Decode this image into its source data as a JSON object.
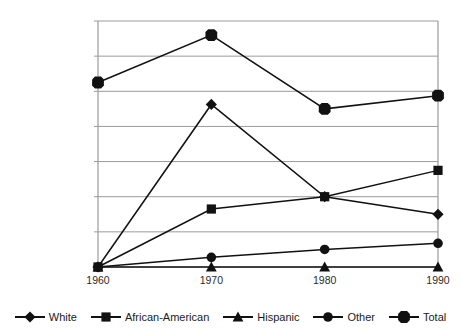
{
  "chart_data": {
    "type": "line",
    "title": "",
    "xlabel": "",
    "ylabel": "",
    "x": [
      1960,
      1970,
      1980,
      1990
    ],
    "categories": [
      "1960",
      "1970",
      "1980",
      "1990"
    ],
    "ylim": [
      0,
      140000
    ],
    "ytick_step": 20000,
    "ytick_labels": [
      "140,000.00",
      "120,000.00",
      "100,000.00",
      "80,000.00",
      "60,000.00",
      "40,000.00",
      "20,000.00",
      "0.00"
    ],
    "ytick_values": [
      140000,
      120000,
      100000,
      80000,
      60000,
      40000,
      20000,
      0
    ],
    "xtick_labels": [
      "1960",
      "1970",
      "1980",
      "1990"
    ],
    "grid": true,
    "grid_axis": "y",
    "legend_position": "bottom",
    "line_color": "#111111",
    "grid_color": "#9a9a9a",
    "series": [
      {
        "name": "White",
        "marker": "diamond",
        "values": [
          0,
          92500,
          40000,
          30000
        ]
      },
      {
        "name": "African-American",
        "marker": "square",
        "values": [
          0,
          33000,
          40000,
          55000
        ]
      },
      {
        "name": "Hispanic",
        "marker": "triangle",
        "values": [
          0,
          0,
          0,
          0
        ]
      },
      {
        "name": "Other",
        "marker": "circle",
        "values": [
          0,
          5500,
          10000,
          13500
        ]
      },
      {
        "name": "Total",
        "marker": "octagon",
        "values": [
          105000,
          132000,
          90000,
          97500
        ]
      }
    ]
  },
  "legend": {
    "items": [
      {
        "label": "White",
        "marker": "diamond"
      },
      {
        "label": "African-American",
        "marker": "square"
      },
      {
        "label": "Hispanic",
        "marker": "triangle"
      },
      {
        "label": "Other",
        "marker": "circle"
      },
      {
        "label": "Total",
        "marker": "octagon"
      }
    ]
  }
}
